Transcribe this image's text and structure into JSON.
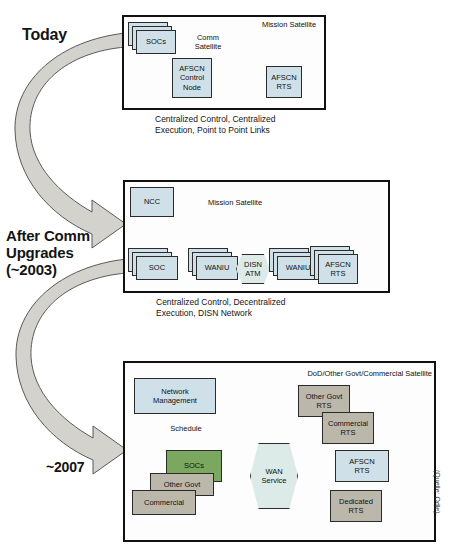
{
  "figure": {
    "source_note": "(Quelle: Odle)"
  },
  "eras": [
    {
      "id": "today",
      "label": "Today"
    },
    {
      "id": "after_comm",
      "label": "After Comm\nUpgrades\n(~2003)"
    },
    {
      "id": "future",
      "label": "~2007"
    }
  ],
  "panels": [
    {
      "id": "today",
      "caption": "Centralized Control, Centralized\nExecution, Point to Point Links",
      "labels": [
        {
          "name": "comm-satellite-label",
          "text": "Comm\nSatellite"
        },
        {
          "name": "mission-satellite-label",
          "text": "Mission Satellite"
        }
      ],
      "nodes": [
        {
          "name": "socs",
          "text": "SOCs",
          "color": "blue",
          "stacked": true
        },
        {
          "name": "afscn-control-node",
          "text": "AFSCN\nControl\nNode",
          "color": "blue",
          "stacked": false
        },
        {
          "name": "afscn-rts",
          "text": "AFSCN\nRTS",
          "color": "blue",
          "stacked": false
        }
      ]
    },
    {
      "id": "after_comm",
      "caption": "Centralized Control, Decentralized\nExecution, DISN Network",
      "labels": [
        {
          "name": "mission-satellite-label",
          "text": "Mission Satellite"
        }
      ],
      "nodes": [
        {
          "name": "ncc",
          "text": "NCC",
          "color": "blue",
          "stacked": false
        },
        {
          "name": "soc",
          "text": "SOC",
          "color": "blue",
          "stacked": true
        },
        {
          "name": "waniu-left",
          "text": "WANIU",
          "color": "blue",
          "stacked": true
        },
        {
          "name": "disn-atm",
          "text": "DISN\nATM",
          "color": "hex",
          "stacked": false
        },
        {
          "name": "waniu-right",
          "text": "WANIU",
          "color": "blue",
          "stacked": true
        },
        {
          "name": "afscn-rts",
          "text": "AFSCN\nRTS",
          "color": "blue",
          "stacked": true
        }
      ]
    },
    {
      "id": "future",
      "caption": "",
      "labels": [
        {
          "name": "satellite-label",
          "text": "DoD/Other Govt/Commercial Satellite"
        },
        {
          "name": "schedule-label",
          "text": "Schedule"
        }
      ],
      "nodes": [
        {
          "name": "network-management",
          "text": "Network\nManagement",
          "color": "blue",
          "stacked": false
        },
        {
          "name": "socs",
          "text": "SOCs",
          "color": "green",
          "stacked": false
        },
        {
          "name": "other-govt",
          "text": "Other Govt",
          "color": "gray",
          "stacked": false
        },
        {
          "name": "commercial",
          "text": "Commercial",
          "color": "gray",
          "stacked": false
        },
        {
          "name": "wan-service",
          "text": "WAN\nService",
          "color": "hex",
          "stacked": false
        },
        {
          "name": "other-govt-rts",
          "text": "Other Govt\nRTS",
          "color": "gray",
          "stacked": false
        },
        {
          "name": "commercial-rts",
          "text": "Commercial\nRTS",
          "color": "gray",
          "stacked": false
        },
        {
          "name": "afscn-rts",
          "text": "AFSCN\nRTS",
          "color": "blue",
          "stacked": false
        },
        {
          "name": "dedicated-rts",
          "text": "Dedicated\nRTS",
          "color": "gray",
          "stacked": false
        }
      ]
    }
  ],
  "colors": {
    "box_blue": "#cfe0e8",
    "box_gray": "#bcb7ab",
    "box_green": "#7aa85f",
    "hex_fill": "#dcebe8",
    "ribbon_fill": "#d4d2cd",
    "outline": "#111111"
  }
}
